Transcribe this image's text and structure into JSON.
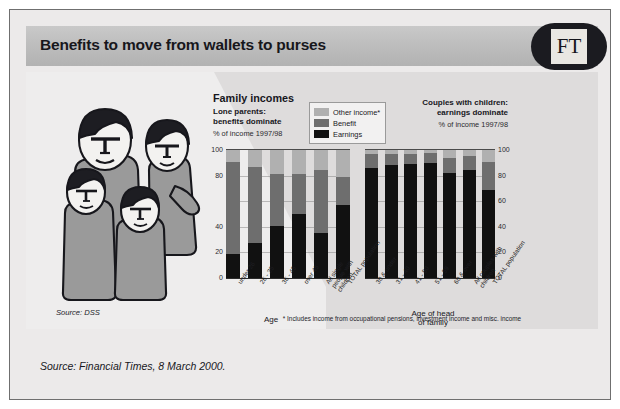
{
  "headline": "Benefits to move from wallets to purses",
  "brand": {
    "logo_text": "FT",
    "logo_bg": "#1b1b20",
    "logo_square": "#e9e7e2"
  },
  "colors": {
    "other_income": "#b0b0b0",
    "benefit": "#6e6e6e",
    "earnings": "#111111",
    "panel_bg": "#e3e1e1",
    "card_bg": "#eceaea",
    "header_band": "#bdbdbd"
  },
  "left_chart": {
    "title": "Family incomes",
    "subtitle_line1": "Lone parents:",
    "subtitle_line2": "benefits dominate",
    "units": "% of income 1997/98",
    "axis_caption": "Age"
  },
  "right_chart": {
    "title_line1": "Couples with children:",
    "title_line2": "earnings dominate",
    "units": "% of income 1997/98",
    "axis_caption_line1": "Age of head",
    "axis_caption_line2": "of family"
  },
  "legend": [
    {
      "label": "Other income*",
      "color": "#b0b0b0",
      "key": "other_income"
    },
    {
      "label": "Benefit",
      "color": "#6e6e6e",
      "key": "benefit"
    },
    {
      "label": "Earnings",
      "color": "#111111",
      "key": "earnings"
    }
  ],
  "footnote": "* Includes income from occupational pensions, investment income and misc. income",
  "source_chart": "Source: DSS",
  "source_page": "Source: Financial Times, 8 March 2000.",
  "chart_data": [
    {
      "type": "bar",
      "id": "lone-parents",
      "stacked": true,
      "title": "Family incomes",
      "subtitle": "Lone parents: benefits dominate",
      "xlabel": "Age",
      "ylabel": "% of income 1997/98",
      "ylim": [
        0,
        100
      ],
      "yticks": [
        0,
        20,
        40,
        60,
        80,
        100
      ],
      "ytick_labels": [
        "0",
        "20",
        "40",
        "",
        "80",
        "100"
      ],
      "axis_position": "left",
      "grid": true,
      "legend_position": "top-right",
      "categories": [
        "under 26",
        "26 - 35",
        "36 - 45",
        "over 45",
        "All single people with children",
        "TOTAL population"
      ],
      "series": [
        {
          "name": "Earnings",
          "color": "#111111",
          "values": [
            19,
            27,
            41,
            50,
            35,
            57
          ]
        },
        {
          "name": "Benefit",
          "color": "#6e6e6e",
          "values": [
            72,
            60,
            40,
            31,
            49,
            22
          ]
        },
        {
          "name": "Other income*",
          "color": "#b0b0b0",
          "values": [
            9,
            13,
            19,
            19,
            16,
            21
          ]
        }
      ]
    },
    {
      "type": "bar",
      "id": "couples-with-children",
      "stacked": true,
      "title": "Couples with children: earnings dominate",
      "xlabel": "Age of head of family",
      "ylabel": "% of income 1997/98",
      "ylim": [
        0,
        100
      ],
      "yticks": [
        0,
        20,
        40,
        60,
        80,
        100
      ],
      "ytick_labels": [
        "0",
        "20",
        "40",
        "60",
        "80",
        "100"
      ],
      "axis_position": "right",
      "grid": true,
      "categories": [
        "30 & under",
        "31 - 40",
        "41 - 50",
        "51 - 59",
        "60 & over",
        "All couples with children",
        "TOTAL population"
      ],
      "series": [
        {
          "name": "Earnings",
          "color": "#111111",
          "values": [
            86,
            88,
            89,
            90,
            82,
            84,
            69
          ]
        },
        {
          "name": "Benefit",
          "color": "#6e6e6e",
          "values": [
            11,
            9,
            8,
            8,
            12,
            11,
            22
          ]
        },
        {
          "name": "Other income*",
          "color": "#b0b0b0",
          "values": [
            3,
            3,
            3,
            2,
            6,
            5,
            9
          ]
        }
      ]
    }
  ]
}
